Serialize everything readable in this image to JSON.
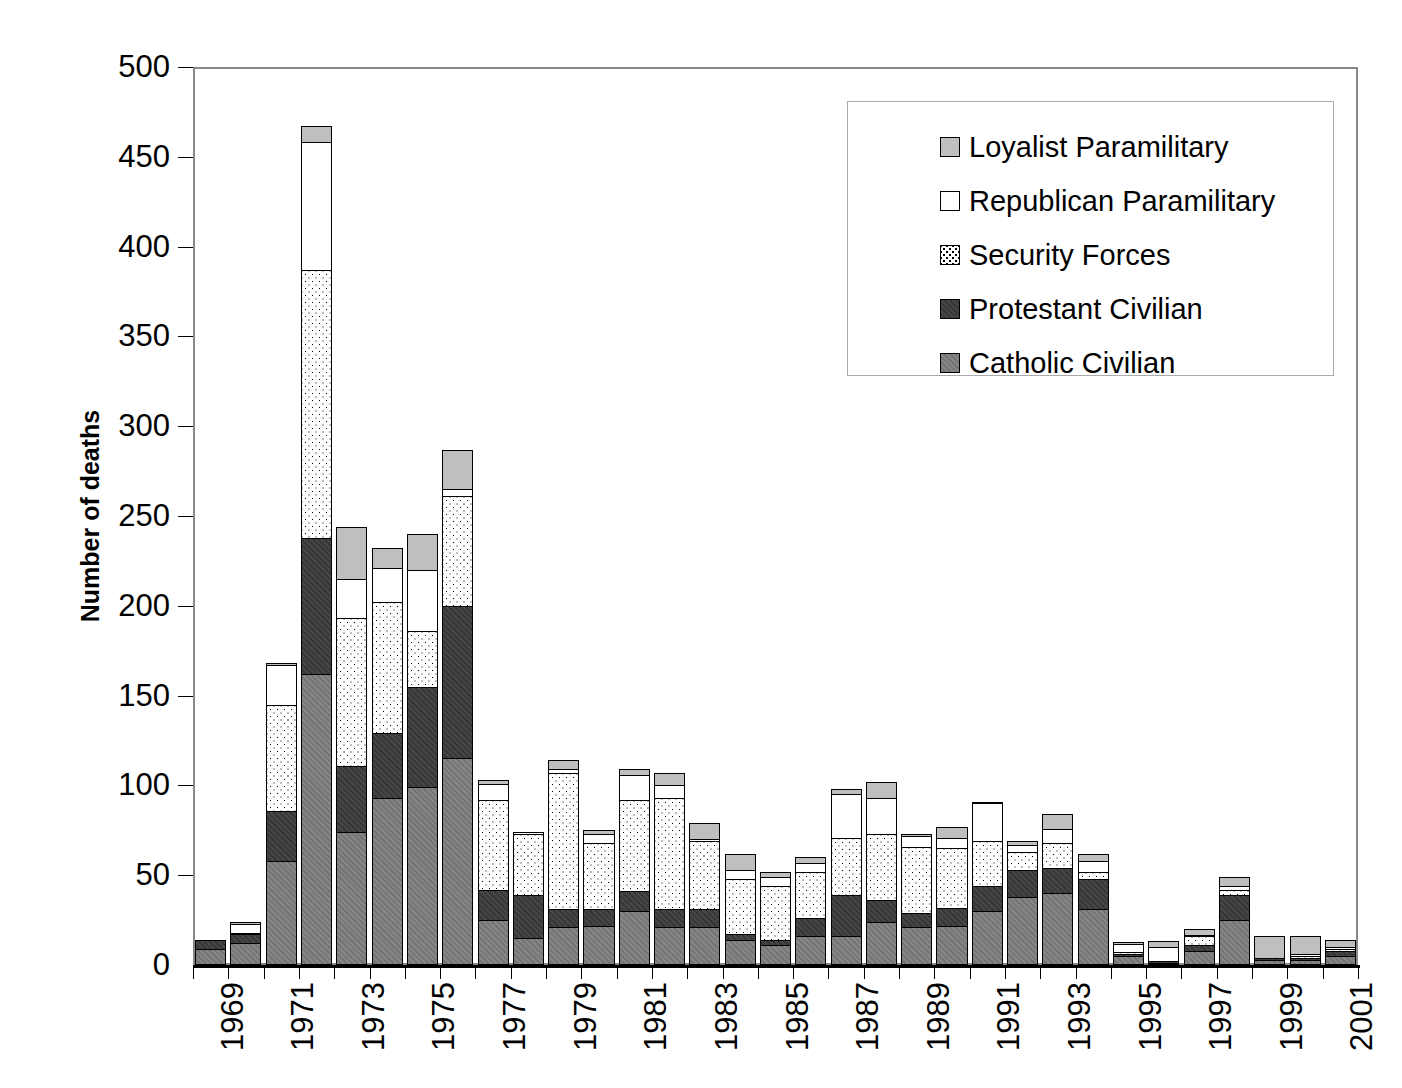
{
  "chart_data": {
    "type": "bar",
    "stacked": true,
    "title": "",
    "xlabel": "",
    "ylabel": "Number of deaths",
    "ylim": [
      0,
      500
    ],
    "yticks": [
      0,
      50,
      100,
      150,
      200,
      250,
      300,
      350,
      400,
      450,
      500
    ],
    "grid": false,
    "legend_position": "top-right",
    "x": [
      1969,
      1970,
      1971,
      1972,
      1973,
      1974,
      1975,
      1976,
      1977,
      1978,
      1979,
      1980,
      1981,
      1982,
      1983,
      1984,
      1985,
      1986,
      1987,
      1988,
      1989,
      1990,
      1991,
      1992,
      1993,
      1994,
      1995,
      1996,
      1997,
      1998,
      1999,
      2000,
      2001
    ],
    "xtick_labels": [
      "1969",
      "",
      "1971",
      "",
      "1973",
      "",
      "1975",
      "",
      "1977",
      "",
      "1979",
      "",
      "1981",
      "",
      "1983",
      "",
      "1985",
      "",
      "1987",
      "",
      "1989",
      "",
      "1991",
      "",
      "1993",
      "",
      "1995",
      "",
      "1997",
      "",
      "1999",
      "",
      "2001"
    ],
    "series": [
      {
        "name": "Catholic Civilian",
        "color": "#7d7d7d",
        "pattern": "diagonal-hatch",
        "values": [
          9,
          12,
          58,
          162,
          74,
          93,
          99,
          115,
          25,
          15,
          21,
          22,
          30,
          21,
          21,
          14,
          11,
          16,
          16,
          24,
          21,
          22,
          30,
          38,
          40,
          31,
          5,
          1,
          8,
          25,
          3,
          3,
          5
        ]
      },
      {
        "name": "Protestant Civilian",
        "color": "#3a3a3a",
        "pattern": "dark-solid",
        "values": [
          5,
          5,
          28,
          76,
          37,
          36,
          56,
          85,
          17,
          24,
          10,
          9,
          11,
          10,
          10,
          3,
          3,
          10,
          23,
          12,
          8,
          10,
          14,
          15,
          14,
          17,
          1,
          1,
          3,
          14,
          1,
          1,
          3
        ]
      },
      {
        "name": "Security Forces",
        "color": "#ffffff",
        "pattern": "dotted",
        "values": [
          0,
          1,
          59,
          149,
          82,
          73,
          31,
          61,
          50,
          34,
          76,
          37,
          51,
          62,
          38,
          31,
          30,
          26,
          32,
          37,
          37,
          33,
          25,
          10,
          14,
          4,
          1,
          0,
          5,
          3,
          0,
          1,
          1
        ]
      },
      {
        "name": "Republican Paramilitary",
        "color": "#ffffff",
        "pattern": "open",
        "values": [
          0,
          5,
          22,
          71,
          22,
          19,
          34,
          4,
          9,
          1,
          2,
          5,
          14,
          7,
          1,
          5,
          5,
          5,
          24,
          20,
          6,
          6,
          21,
          4,
          8,
          6,
          5,
          8,
          1,
          2,
          0,
          1,
          1
        ]
      },
      {
        "name": "Loyalist Paramilitary",
        "color": "#bfbfbf",
        "pattern": "light-solid",
        "values": [
          0,
          1,
          1,
          9,
          29,
          11,
          20,
          22,
          2,
          0,
          5,
          2,
          3,
          7,
          9,
          9,
          3,
          3,
          3,
          9,
          1,
          6,
          1,
          2,
          8,
          4,
          1,
          3,
          3,
          5,
          12,
          10,
          4
        ]
      }
    ],
    "totals": [
      14,
      24,
      168,
      467,
      244,
      232,
      240,
      287,
      103,
      74,
      114,
      75,
      109,
      107,
      79,
      62,
      52,
      60,
      98,
      102,
      73,
      77,
      91,
      69,
      84,
      62,
      13,
      13,
      20,
      49,
      16,
      16,
      14
    ]
  },
  "legend": {
    "items": [
      {
        "label": "Loyalist Paramilitary",
        "key": "f-loyalist"
      },
      {
        "label": "Republican Paramilitary",
        "key": "f-republican"
      },
      {
        "label": "Security Forces",
        "key": "f-security"
      },
      {
        "label": "Protestant Civilian",
        "key": "f-protestant"
      },
      {
        "label": "Catholic Civilian",
        "key": "f-catholic"
      }
    ]
  },
  "axis": {
    "y_title": "Number of deaths"
  }
}
